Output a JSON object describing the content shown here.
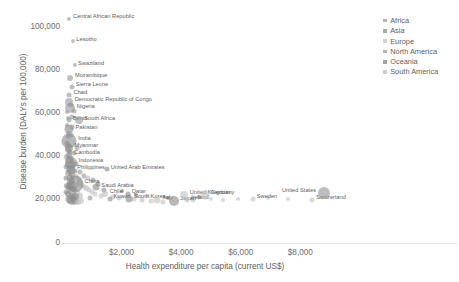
{
  "chart_data": {
    "type": "scatter",
    "title": "",
    "subtitle": "",
    "xlabel": "Health expenditure per capita (current US$)",
    "ylabel": "Disease burden (DALYs per 100,000)",
    "xlim": [
      0,
      9600
    ],
    "ylim": [
      0,
      108000
    ],
    "grid": false,
    "legend_position": "top-right",
    "xticks": [
      {
        "value": 0,
        "label": ""
      },
      {
        "value": 2000,
        "label": "$2,000"
      },
      {
        "value": 4000,
        "label": "$4,000"
      },
      {
        "value": 6000,
        "label": "$6,000"
      },
      {
        "value": 8000,
        "label": "$8,000"
      }
    ],
    "yticks": [
      {
        "value": 0,
        "label": "0"
      },
      {
        "value": 20000,
        "label": "20,000"
      },
      {
        "value": 40000,
        "label": "40,000"
      },
      {
        "value": 60000,
        "label": "60,000"
      },
      {
        "value": 80000,
        "label": "80,000"
      },
      {
        "value": 100000,
        "label": "100,000"
      }
    ],
    "legend": [
      {
        "name": "Africa",
        "color": "#9a9a9a"
      },
      {
        "name": "Asia",
        "color": "#8d8d8d"
      },
      {
        "name": "Europe",
        "color": "#c2c2c2"
      },
      {
        "name": "North America",
        "color": "#969696"
      },
      {
        "name": "Oceania",
        "color": "#858585"
      },
      {
        "name": "South America",
        "color": "#bcbcbc"
      }
    ],
    "size_encoding": "population",
    "points": [
      {
        "label": "Central African Republic",
        "x": 250,
        "y": 104000,
        "size": 4,
        "region": "Africa",
        "label_side": "right"
      },
      {
        "label": "Lesotho",
        "x": 360,
        "y": 93500,
        "size": 4,
        "region": "Africa",
        "label_side": "right"
      },
      {
        "label": "Swaziland",
        "x": 420,
        "y": 82500,
        "size": 4,
        "region": "Africa",
        "label_side": "right"
      },
      {
        "label": "Mozambique",
        "x": 280,
        "y": 76500,
        "size": 6,
        "region": "Africa",
        "label_side": "right"
      },
      {
        "label": "Sierra Leone",
        "x": 320,
        "y": 72500,
        "size": 5,
        "region": "Africa",
        "label_side": "right"
      },
      {
        "label": "Chad",
        "x": 250,
        "y": 68800,
        "size": 5,
        "region": "Africa",
        "label_side": "right"
      },
      {
        "label": "Democratic Republic of Congo",
        "x": 240,
        "y": 65500,
        "size": 8,
        "region": "Africa",
        "label_side": "right"
      },
      {
        "label": "Nigeria",
        "x": 270,
        "y": 62500,
        "size": 10,
        "region": "Africa",
        "label_side": "right"
      },
      {
        "label": "Benin",
        "x": 230,
        "y": 56800,
        "size": 5,
        "region": "Africa",
        "label_side": "right"
      },
      {
        "label": "South Africa",
        "x": 560,
        "y": 56800,
        "size": 8,
        "region": "Africa",
        "label_side": "right"
      },
      {
        "label": "Pakistan",
        "x": 250,
        "y": 52800,
        "size": 9,
        "region": "Asia",
        "label_side": "right"
      },
      {
        "label": "India",
        "x": 240,
        "y": 47500,
        "size": 15,
        "region": "Asia",
        "label_side": "right"
      },
      {
        "label": "Myanmar",
        "x": 230,
        "y": 44200,
        "size": 8,
        "region": "Asia",
        "label_side": "right"
      },
      {
        "label": "Cambodia",
        "x": 250,
        "y": 40800,
        "size": 6,
        "region": "Asia",
        "label_side": "right"
      },
      {
        "label": "Indonesia",
        "x": 300,
        "y": 37200,
        "size": 12,
        "region": "Asia",
        "label_side": "right"
      },
      {
        "label": "Philippines",
        "x": 310,
        "y": 34000,
        "size": 9,
        "region": "Asia",
        "label_side": "right"
      },
      {
        "label": "China",
        "x": 420,
        "y": 27500,
        "size": 17,
        "region": "Asia",
        "label_side": "right"
      },
      {
        "label": "United Arab Emirates",
        "x": 1500,
        "y": 34200,
        "size": 5,
        "region": "Asia",
        "label_side": "right"
      },
      {
        "label": "Saudi Arabia",
        "x": 1150,
        "y": 25800,
        "size": 7,
        "region": "Asia",
        "label_side": "right"
      },
      {
        "label": "Chile",
        "x": 1450,
        "y": 22800,
        "size": 6,
        "region": "South America",
        "label_side": "right"
      },
      {
        "label": "Qatar",
        "x": 2200,
        "y": 22800,
        "size": 5,
        "region": "Asia",
        "label_side": "right"
      },
      {
        "label": "Kuwait",
        "x": 1600,
        "y": 20400,
        "size": 5,
        "region": "Asia",
        "label_side": "right"
      },
      {
        "label": "South Korea",
        "x": 2250,
        "y": 20400,
        "size": 7,
        "region": "Asia",
        "label_side": "right"
      },
      {
        "label": "Italy",
        "x": 3200,
        "y": 20100,
        "size": 7,
        "region": "Europe",
        "label_side": "right"
      },
      {
        "label": "Japan",
        "x": 3750,
        "y": 19500,
        "size": 10,
        "region": "Asia",
        "label_side": "right"
      },
      {
        "label": "Ireland",
        "x": 4200,
        "y": 20100,
        "size": 5,
        "region": "Europe",
        "label_side": "right"
      },
      {
        "label": "United Kingdom",
        "x": 4100,
        "y": 22400,
        "size": 8,
        "region": "Europe",
        "label_side": "right"
      },
      {
        "label": "Germany",
        "x": 4800,
        "y": 22400,
        "size": 9,
        "region": "Europe",
        "label_side": "right"
      },
      {
        "label": "Sweden",
        "x": 6400,
        "y": 20400,
        "size": 5,
        "region": "Europe",
        "label_side": "right"
      },
      {
        "label": "Switzerland",
        "x": 8400,
        "y": 20100,
        "size": 5,
        "region": "Europe",
        "label_side": "right"
      },
      {
        "label": "United States",
        "x": 8800,
        "y": 23400,
        "size": 12,
        "region": "North America",
        "label_side": "left"
      }
    ],
    "unlabeled_points": [
      {
        "x": 180,
        "y": 60500,
        "size": 4,
        "region": "Africa"
      },
      {
        "x": 200,
        "y": 58000,
        "size": 4,
        "region": "Africa"
      },
      {
        "x": 160,
        "y": 54500,
        "size": 4,
        "region": "Africa"
      },
      {
        "x": 210,
        "y": 51000,
        "size": 4,
        "region": "Africa"
      },
      {
        "x": 190,
        "y": 49500,
        "size": 5,
        "region": "Africa"
      },
      {
        "x": 170,
        "y": 46500,
        "size": 5,
        "region": "Africa"
      },
      {
        "x": 230,
        "y": 45500,
        "size": 4,
        "region": "Africa"
      },
      {
        "x": 200,
        "y": 43000,
        "size": 6,
        "region": "Africa"
      },
      {
        "x": 260,
        "y": 42000,
        "size": 5,
        "region": "Asia"
      },
      {
        "x": 175,
        "y": 40000,
        "size": 6,
        "region": "Africa"
      },
      {
        "x": 300,
        "y": 39500,
        "size": 5,
        "region": "Asia"
      },
      {
        "x": 220,
        "y": 38500,
        "size": 7,
        "region": "Africa"
      },
      {
        "x": 340,
        "y": 37500,
        "size": 5,
        "region": "Asia"
      },
      {
        "x": 190,
        "y": 36000,
        "size": 6,
        "region": "Africa"
      },
      {
        "x": 380,
        "y": 35500,
        "size": 5,
        "region": "Asia"
      },
      {
        "x": 260,
        "y": 34500,
        "size": 7,
        "region": "Asia"
      },
      {
        "x": 430,
        "y": 33500,
        "size": 5,
        "region": "Asia"
      },
      {
        "x": 210,
        "y": 32500,
        "size": 6,
        "region": "Africa"
      },
      {
        "x": 330,
        "y": 31500,
        "size": 6,
        "region": "Asia"
      },
      {
        "x": 480,
        "y": 31000,
        "size": 5,
        "region": "South America"
      },
      {
        "x": 260,
        "y": 30000,
        "size": 7,
        "region": "Asia"
      },
      {
        "x": 560,
        "y": 29500,
        "size": 5,
        "region": "South America"
      },
      {
        "x": 350,
        "y": 28800,
        "size": 6,
        "region": "Asia"
      },
      {
        "x": 620,
        "y": 28000,
        "size": 6,
        "region": "South America"
      },
      {
        "x": 300,
        "y": 27000,
        "size": 8,
        "region": "Asia"
      },
      {
        "x": 700,
        "y": 26500,
        "size": 5,
        "region": "South America"
      },
      {
        "x": 250,
        "y": 26000,
        "size": 7,
        "region": "Asia"
      },
      {
        "x": 800,
        "y": 25500,
        "size": 6,
        "region": "South America"
      },
      {
        "x": 400,
        "y": 25000,
        "size": 6,
        "region": "Asia"
      },
      {
        "x": 900,
        "y": 24500,
        "size": 5,
        "region": "Europe"
      },
      {
        "x": 340,
        "y": 24000,
        "size": 9,
        "region": "Asia"
      },
      {
        "x": 1000,
        "y": 23500,
        "size": 5,
        "region": "Europe"
      },
      {
        "x": 500,
        "y": 23000,
        "size": 7,
        "region": "South America"
      },
      {
        "x": 1100,
        "y": 22500,
        "size": 5,
        "region": "Europe"
      },
      {
        "x": 600,
        "y": 22000,
        "size": 6,
        "region": "South America"
      },
      {
        "x": 1300,
        "y": 21800,
        "size": 5,
        "region": "Europe"
      },
      {
        "x": 450,
        "y": 21500,
        "size": 8,
        "region": "Asia"
      },
      {
        "x": 1700,
        "y": 21200,
        "size": 5,
        "region": "Europe"
      },
      {
        "x": 380,
        "y": 21000,
        "size": 7,
        "region": "Asia"
      },
      {
        "x": 1900,
        "y": 20800,
        "size": 5,
        "region": "Europe"
      },
      {
        "x": 280,
        "y": 20500,
        "size": 9,
        "region": "Asia"
      },
      {
        "x": 2400,
        "y": 20300,
        "size": 5,
        "region": "Europe"
      },
      {
        "x": 320,
        "y": 20000,
        "size": 10,
        "region": "Asia"
      },
      {
        "x": 2700,
        "y": 19800,
        "size": 5,
        "region": "Europe"
      },
      {
        "x": 420,
        "y": 19600,
        "size": 7,
        "region": "Asia"
      },
      {
        "x": 3000,
        "y": 19400,
        "size": 5,
        "region": "Europe"
      },
      {
        "x": 530,
        "y": 19200,
        "size": 6,
        "region": "South America"
      },
      {
        "x": 3400,
        "y": 19000,
        "size": 5,
        "region": "Europe"
      },
      {
        "x": 650,
        "y": 19500,
        "size": 6,
        "region": "Europe"
      },
      {
        "x": 4400,
        "y": 19800,
        "size": 5,
        "region": "Europe"
      },
      {
        "x": 5000,
        "y": 20200,
        "size": 4,
        "region": "Europe"
      },
      {
        "x": 5400,
        "y": 20000,
        "size": 4,
        "region": "Europe"
      },
      {
        "x": 3550,
        "y": 21000,
        "size": 4,
        "region": "Oceania"
      },
      {
        "x": 4600,
        "y": 21400,
        "size": 4,
        "region": "Oceania"
      },
      {
        "x": 2900,
        "y": 21800,
        "size": 4,
        "region": "Europe"
      },
      {
        "x": 2500,
        "y": 22400,
        "size": 4,
        "region": "Asia"
      },
      {
        "x": 1200,
        "y": 27500,
        "size": 5,
        "region": "Asia"
      },
      {
        "x": 750,
        "y": 31000,
        "size": 5,
        "region": "Africa"
      },
      {
        "x": 480,
        "y": 36500,
        "size": 5,
        "region": "Africa"
      },
      {
        "x": 390,
        "y": 41500,
        "size": 5,
        "region": "Africa"
      },
      {
        "x": 150,
        "y": 35000,
        "size": 5,
        "region": "Africa"
      },
      {
        "x": 140,
        "y": 30000,
        "size": 5,
        "region": "Asia"
      },
      {
        "x": 160,
        "y": 26500,
        "size": 6,
        "region": "Asia"
      },
      {
        "x": 130,
        "y": 23500,
        "size": 5,
        "region": "Asia"
      },
      {
        "x": 200,
        "y": 22500,
        "size": 6,
        "region": "Asia"
      },
      {
        "x": 600,
        "y": 33000,
        "size": 5,
        "region": "Africa"
      },
      {
        "x": 520,
        "y": 44000,
        "size": 5,
        "region": "Africa"
      },
      {
        "x": 310,
        "y": 50000,
        "size": 5,
        "region": "Africa"
      },
      {
        "x": 350,
        "y": 58500,
        "size": 5,
        "region": "Africa"
      },
      {
        "x": 290,
        "y": 64000,
        "size": 5,
        "region": "Africa"
      },
      {
        "x": 410,
        "y": 61000,
        "size": 5,
        "region": "Africa"
      },
      {
        "x": 330,
        "y": 54000,
        "size": 5,
        "region": "Africa"
      },
      {
        "x": 470,
        "y": 27000,
        "size": 6,
        "region": "South America"
      },
      {
        "x": 880,
        "y": 30000,
        "size": 5,
        "region": "South America"
      },
      {
        "x": 1050,
        "y": 29000,
        "size": 5,
        "region": "North America"
      },
      {
        "x": 950,
        "y": 21000,
        "size": 5,
        "region": "North America"
      },
      {
        "x": 1400,
        "y": 24500,
        "size": 5,
        "region": "Asia"
      },
      {
        "x": 2000,
        "y": 24000,
        "size": 4,
        "region": "Oceania"
      },
      {
        "x": 5900,
        "y": 20600,
        "size": 4,
        "region": "Europe"
      },
      {
        "x": 6900,
        "y": 20800,
        "size": 4,
        "region": "Europe"
      },
      {
        "x": 7600,
        "y": 20500,
        "size": 4,
        "region": "Europe"
      }
    ]
  }
}
